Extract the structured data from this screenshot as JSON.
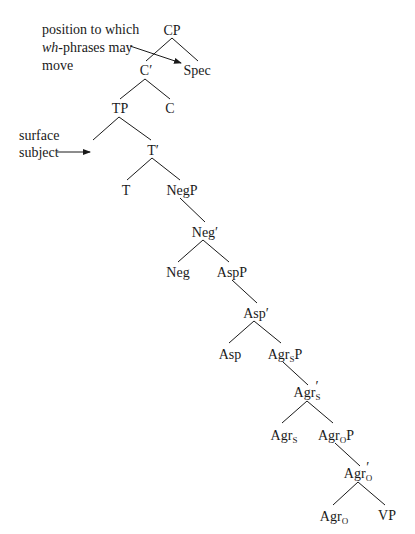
{
  "diagram": {
    "type": "syntax-tree",
    "annotations": {
      "wh_position": {
        "line1": "position to which",
        "line2_italic": "wh",
        "line2_rest": "-phrases may",
        "line3": "move",
        "target": "Spec"
      },
      "surface_subject": {
        "line1": "surface",
        "line2": "subject"
      }
    },
    "nodes": {
      "cp": "CP",
      "spec": "Spec",
      "c_bar": "C′",
      "tp": "TP",
      "c": "C",
      "t_bar": "T′",
      "t": "T",
      "negp": "NegP",
      "neg_bar": "Neg′",
      "neg": "Neg",
      "aspp": "AspP",
      "asp_bar": "Asp′",
      "asp": "Asp",
      "agrsp_base": "Agr",
      "agrsp_sub": "S",
      "agrsp_tail": "P",
      "agrs_bar_base": "Agr",
      "agrs_bar_sub": "S",
      "agrs_bar_prime": "′",
      "agrs_base": "Agr",
      "agrs_sub": "S",
      "agrop_base": "Agr",
      "agrop_sub": "O",
      "agrop_tail": "P",
      "agro_bar_base": "Agr",
      "agro_bar_sub": "O",
      "agro_bar_prime": "′",
      "agro_base": "Agr",
      "agro_sub": "O",
      "vp": "VP"
    },
    "edges": [
      [
        "CP",
        "C′"
      ],
      [
        "CP",
        "Spec"
      ],
      [
        "C′",
        "TP"
      ],
      [
        "C′",
        "C"
      ],
      [
        "TP",
        "surface subject position"
      ],
      [
        "TP",
        "T′"
      ],
      [
        "T′",
        "T"
      ],
      [
        "T′",
        "NegP"
      ],
      [
        "NegP",
        "Neg′"
      ],
      [
        "Neg′",
        "Neg"
      ],
      [
        "Neg′",
        "AspP"
      ],
      [
        "AspP",
        "Asp′"
      ],
      [
        "Asp′",
        "Asp"
      ],
      [
        "Asp′",
        "AgrSP"
      ],
      [
        "AgrSP",
        "AgrS′"
      ],
      [
        "AgrS′",
        "AgrS"
      ],
      [
        "AgrS′",
        "AgrOP"
      ],
      [
        "AgrOP",
        "AgrO′"
      ],
      [
        "AgrO′",
        "AgrO"
      ],
      [
        "AgrO′",
        "VP"
      ]
    ]
  }
}
